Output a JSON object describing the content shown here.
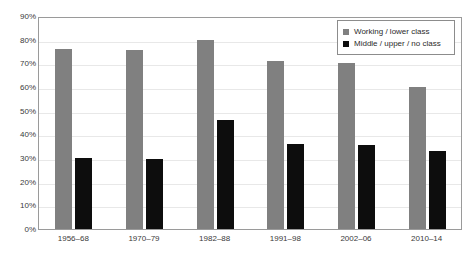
{
  "chart_data": {
    "type": "bar",
    "title": "",
    "subtitle": "",
    "xlabel": "",
    "ylabel": "",
    "ylim": [
      0,
      90
    ],
    "ytick_labels": [
      "90%",
      "80%",
      "70%",
      "60%",
      "50%",
      "40%",
      "30%",
      "20%",
      "10%",
      "0%"
    ],
    "ytick_values": [
      90,
      80,
      70,
      60,
      50,
      40,
      30,
      20,
      10,
      0
    ],
    "grid": true,
    "legend_position": "top-right",
    "categories": [
      "1956–68",
      "1970–79",
      "1982–88",
      "1991–98",
      "2002–06",
      "2010–14"
    ],
    "series": [
      {
        "name": "Working / lower class",
        "color": "#808080",
        "values": [
          76,
          75.5,
          80,
          71,
          70,
          60
        ]
      },
      {
        "name": "Middle / upper / no class",
        "color": "#0d0d0d",
        "values": [
          30,
          29.5,
          46,
          36,
          35.5,
          33
        ]
      }
    ]
  },
  "legend": {
    "items": [
      {
        "label": "Working / lower class",
        "color": "#808080"
      },
      {
        "label": "Middle / upper / no class",
        "color": "#0d0d0d"
      }
    ]
  }
}
